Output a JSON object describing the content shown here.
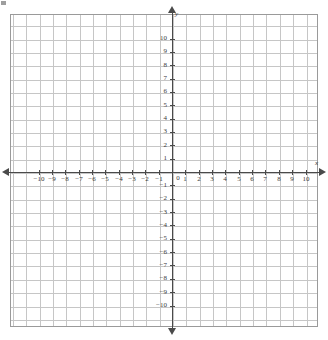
{
  "figure": {
    "kind": "cartesian-coordinate-grid",
    "background_color": "#ffffff",
    "grid_color": "#c6c6c6",
    "grid_border_color": "#9a9a9a",
    "axis_color": "#4a4a4a",
    "label_color": "#3a3a3a"
  },
  "axis_names": {
    "x": "x",
    "y": "y"
  },
  "origin_label": "0",
  "chart_data": {
    "type": "scatter",
    "title": "",
    "xlabel": "x",
    "ylabel": "y",
    "xlim": [
      -11.5,
      11.5
    ],
    "ylim": [
      -11.5,
      11.8
    ],
    "grid": true,
    "legend": null,
    "series": [],
    "x_tick_labels": [
      "−10",
      "−9",
      "−8",
      "−7",
      "−6",
      "−5",
      "−4",
      "−3",
      "−2",
      "−1",
      "1",
      "2",
      "3",
      "4",
      "5",
      "6",
      "7",
      "8",
      "9",
      "10"
    ],
    "x_tick_values": [
      -10,
      -9,
      -8,
      -7,
      -6,
      -5,
      -4,
      -3,
      -2,
      -1,
      1,
      2,
      3,
      4,
      5,
      6,
      7,
      8,
      9,
      10
    ],
    "y_tick_labels": [
      "10",
      "9",
      "8",
      "7",
      "6",
      "5",
      "4",
      "3",
      "2",
      "1",
      "−1",
      "−2",
      "−3",
      "−4",
      "−5",
      "−6",
      "−7",
      "−8",
      "−9",
      "−10"
    ],
    "y_tick_values": [
      10,
      9,
      8,
      7,
      6,
      5,
      4,
      3,
      2,
      1,
      -1,
      -2,
      -3,
      -4,
      -5,
      -6,
      -7,
      -8,
      -9,
      -10
    ],
    "grid_step": 1,
    "arrows": [
      "left",
      "right",
      "up",
      "down"
    ]
  }
}
